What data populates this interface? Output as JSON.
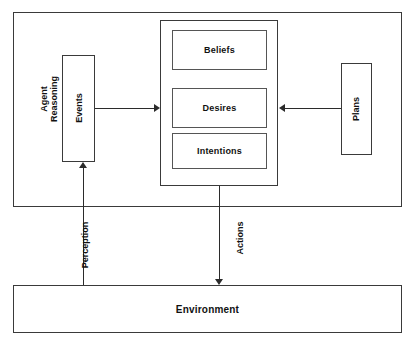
{
  "diagram": {
    "type": "block-diagram",
    "stroke_color": "#2b2b2b",
    "background_color": "#ffffff"
  },
  "agent": {
    "label": "Agent\nReasoning",
    "label_line1": "Agent",
    "label_line2": "Reasoning",
    "events": {
      "label": "Events"
    },
    "bdi": {
      "beliefs": "Beliefs",
      "desires": "Desires",
      "intentions": "Intentions"
    },
    "plans": {
      "label": "Plans"
    }
  },
  "environment": {
    "label": "Environment"
  },
  "connections": {
    "perception": "Perception",
    "actions": "Actions",
    "events_to_bdi": "",
    "plans_to_bdi": ""
  }
}
